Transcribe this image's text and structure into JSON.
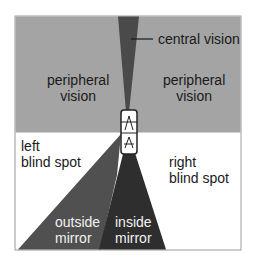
{
  "diagram": {
    "type": "driver vision and blind spots",
    "colors": {
      "peripheral_zone": "#a4a4a4",
      "central_beam": "#4a4a4a",
      "outside_mirror": "#505050",
      "inside_mirror": "#2e2e2e",
      "blind_zone": "#ffffff",
      "frame": "#9a9a9a"
    },
    "labels": {
      "central_vision": "central vision",
      "peripheral_left": "peripheral\nvision",
      "peripheral_right": "peripheral\nvision",
      "left_blind_spot": "left\nblind spot",
      "right_blind_spot": "right\nblind spot",
      "outside_mirror": "outside\nmirror",
      "inside_mirror": "inside\nmirror"
    }
  }
}
